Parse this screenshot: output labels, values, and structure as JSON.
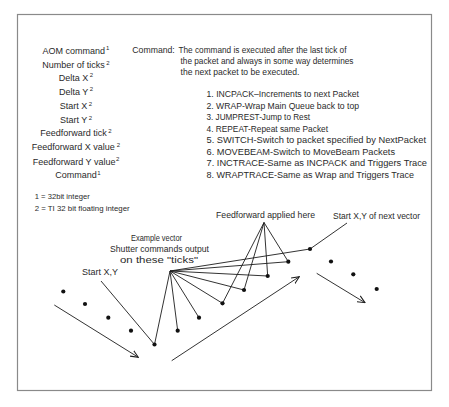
{
  "fields": {
    "items": [
      {
        "label": "AOM command",
        "sup": "1"
      },
      {
        "label": "Number of ticks",
        "sup": "2"
      },
      {
        "label": "Delta X",
        "sup": "2"
      },
      {
        "label": "Delta Y",
        "sup": "2"
      },
      {
        "label": "Start X",
        "sup": "2"
      },
      {
        "label": "Start Y",
        "sup": "2"
      },
      {
        "label": "Feedforward tick",
        "sup": "2"
      },
      {
        "label": "Feedforward X value",
        "sup": "2"
      },
      {
        "label": "Feedforward Y value",
        "sup": "2"
      },
      {
        "label": "Command",
        "sup": "1"
      }
    ]
  },
  "footnotes": [
    "1 = 32bit integer",
    "2 = TI  32 bit floating integer"
  ],
  "command": {
    "label": "Command:",
    "description_lines": [
      "The command is executed after the last tick of",
      "the packet and always in some way determines",
      "the next packet to be executed."
    ],
    "options": [
      "1. INCPACK–Increments to next Packet",
      "2. WRAP-Wrap Main Queue back to top",
      "3. JUMPREST-Jump to Rest",
      "4. REPEAT-Repeat same Packet",
      "5. SWITCH-Switch to packet specified by NextPacket",
      "6. MOVEBEAM-Switch to MoveBeam Packets",
      "7. INCTRACE-Same as INCPACK and Triggers Trace",
      "8. WRAPTRACE-Same as Wrap and Triggers Trace"
    ]
  },
  "diagram": {
    "labels": {
      "feedforward": "Feedforward applied here",
      "start_next": "Start X,Y of next vector",
      "example_line1": "Example vector",
      "example_line2": "Shutter commands output",
      "example_line3": "on these \"ticks\"",
      "start": "Start X,Y"
    },
    "dots": {
      "previous_vector": [
        [
          63.3,
          291.5
        ],
        [
          85,
          304
        ],
        [
          108.3,
          317.7
        ],
        [
          131,
          330.7
        ]
      ],
      "example_vector_ticks": [
        [
          154.5,
          344.5
        ],
        [
          177.7,
          330.7
        ],
        [
          199,
          317.7
        ],
        [
          222.5,
          303.3
        ],
        [
          244,
          290
        ],
        [
          267.7,
          276
        ],
        [
          288.3,
          261.7
        ],
        [
          310,
          249
        ]
      ],
      "next_vector": [
        [
          331,
          261.5
        ],
        [
          353.3,
          274.3
        ],
        [
          376.7,
          289
        ]
      ]
    },
    "leaders": {
      "shutter_ticks": {
        "from": [
          170,
          271
        ],
        "to": [
          [
            154.5,
            344.5
          ],
          [
            177.7,
            330.7
          ],
          [
            199,
            317.7
          ],
          [
            222.5,
            303.3
          ],
          [
            244,
            290
          ],
          [
            267.7,
            276
          ],
          [
            288.3,
            261.7
          ],
          [
            310,
            249
          ]
        ]
      },
      "feedforward": {
        "from": [
          264,
          222.5
        ],
        "to": [
          [
            222.5,
            303.3
          ],
          [
            244,
            290
          ],
          [
            267.7,
            276
          ],
          [
            288.3,
            261.7
          ]
        ]
      },
      "start_xy": {
        "from": [
          101,
          281
        ],
        "to": [
          [
            154.5,
            344.5
          ]
        ]
      },
      "start_xy_next": {
        "from": [
          347,
          223
        ],
        "to": [
          [
            310,
            249
          ]
        ]
      }
    },
    "arrows": [
      {
        "from": [
          54.3,
          305
        ],
        "to": [
          138.3,
          357.3
        ]
      },
      {
        "from": [
          171.7,
          360.7
        ],
        "to": [
          299.3,
          276.7
        ]
      },
      {
        "from": [
          316.7,
          273.3
        ],
        "to": [
          365,
          302.7
        ]
      }
    ]
  }
}
